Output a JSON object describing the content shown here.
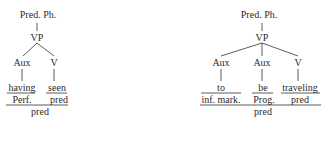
{
  "trees": [
    {
      "root": "Pred. Ph.",
      "vp": "VP",
      "nodes": [
        {
          "category": "Aux",
          "word": "having",
          "function": "Perf."
        },
        {
          "category": "V",
          "word": "seen",
          "function": "pred"
        }
      ],
      "combined_function": "pred"
    },
    {
      "root": "Pred. Ph.",
      "vp": "VP",
      "nodes": [
        {
          "category": "Aux",
          "word": "to",
          "function": "inf. mark."
        },
        {
          "category": "Aux",
          "word": "be",
          "function": "Prog."
        },
        {
          "category": "V",
          "word": "traveling",
          "function": "pred"
        }
      ],
      "combined_function": "pred"
    }
  ]
}
